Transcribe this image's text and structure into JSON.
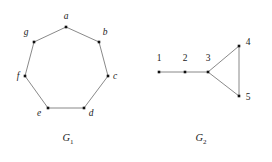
{
  "figure": {
    "width": 272,
    "height": 162,
    "background_color": "#ffffff",
    "edge_color": "#6b6b6b",
    "vertex_color": "#111111",
    "text_color": "#1a1a1a"
  },
  "graphs": [
    {
      "id": "G1",
      "caption_base": "G",
      "caption_sub": "1",
      "caption_x": 68,
      "caption_y": 141,
      "description": "cycle on seven vertices",
      "vertices": [
        {
          "label": "a",
          "x": 66,
          "y": 27,
          "label_x": 66,
          "label_y": 19,
          "anchor": "middle"
        },
        {
          "label": "b",
          "x": 99,
          "y": 42,
          "label_x": 105,
          "label_y": 35,
          "anchor": "middle"
        },
        {
          "label": "c",
          "x": 108,
          "y": 76,
          "label_x": 115,
          "label_y": 79,
          "anchor": "middle"
        },
        {
          "label": "d",
          "x": 84,
          "y": 108,
          "label_x": 91,
          "label_y": 116,
          "anchor": "middle"
        },
        {
          "label": "e",
          "x": 48,
          "y": 108,
          "label_x": 39,
          "label_y": 116,
          "anchor": "middle"
        },
        {
          "label": "f",
          "x": 25,
          "y": 76,
          "label_x": 18,
          "label_y": 79,
          "anchor": "middle"
        },
        {
          "label": "g",
          "x": 34,
          "y": 42,
          "label_x": 26,
          "label_y": 35,
          "anchor": "middle"
        }
      ],
      "edges": [
        {
          "from": "a",
          "to": "b"
        },
        {
          "from": "b",
          "to": "c"
        },
        {
          "from": "c",
          "to": "d"
        },
        {
          "from": "d",
          "to": "e"
        },
        {
          "from": "e",
          "to": "f"
        },
        {
          "from": "f",
          "to": "g"
        },
        {
          "from": "g",
          "to": "a"
        }
      ]
    },
    {
      "id": "G2",
      "caption_base": "G",
      "caption_sub": "2",
      "caption_x": 201,
      "caption_y": 141,
      "description": "path of three vertices attached to a triangle",
      "vertices": [
        {
          "label": "1",
          "x": 159,
          "y": 72,
          "label_x": 159,
          "label_y": 61,
          "anchor": "middle"
        },
        {
          "label": "2",
          "x": 185,
          "y": 72,
          "label_x": 185,
          "label_y": 61,
          "anchor": "middle"
        },
        {
          "label": "3",
          "x": 208,
          "y": 72,
          "label_x": 208,
          "label_y": 61,
          "anchor": "middle"
        },
        {
          "label": "4",
          "x": 239,
          "y": 46,
          "label_x": 248,
          "label_y": 45,
          "anchor": "middle"
        },
        {
          "label": "5",
          "x": 239,
          "y": 96,
          "label_x": 248,
          "label_y": 100,
          "anchor": "middle"
        }
      ],
      "edges": [
        {
          "from": "1",
          "to": "2"
        },
        {
          "from": "2",
          "to": "3"
        },
        {
          "from": "3",
          "to": "4"
        },
        {
          "from": "3",
          "to": "5"
        },
        {
          "from": "4",
          "to": "5"
        }
      ]
    }
  ]
}
